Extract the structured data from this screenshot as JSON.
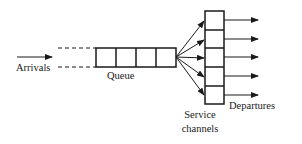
{
  "diagram": {
    "type": "queueing-system",
    "labels": {
      "arrivals": "Arrivals",
      "queue": "Queue",
      "service_line1": "Service",
      "service_line2": "channels",
      "departures": "Departures"
    },
    "queue_cells": 4,
    "service_channels": 5,
    "departure_arrows": 5,
    "colors": {
      "stroke": "#1a1a1a",
      "background": "#ffffff"
    }
  }
}
